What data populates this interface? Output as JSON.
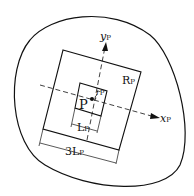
{
  "labels": {
    "yP": {
      "main": "y",
      "sub": "P"
    },
    "xP": {
      "main": "x",
      "sub": "P"
    },
    "RP": {
      "main": "R",
      "sub": "P"
    },
    "rP": {
      "main": "r",
      "sub": "P"
    },
    "P": {
      "main": "P"
    },
    "LP": {
      "main": "L",
      "sub": "P"
    },
    "threeLP": {
      "main": "3L",
      "sub": "P"
    }
  }
}
